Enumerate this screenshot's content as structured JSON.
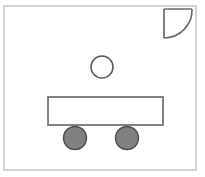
{
  "canvas": {
    "name": "shape-drawing-canvas",
    "width": 205,
    "height": 177,
    "background_color": "#ffffff",
    "description": "Simple line drawing of a cart or vehicle made of basic geometric shapes"
  },
  "frame": {
    "name": "outer-frame",
    "x": 4,
    "y": 6,
    "width": 192,
    "height": 164,
    "stroke_color": "#c9c9c9",
    "stroke_width": 1.6,
    "fill_color": "none"
  },
  "shapes": [
    {
      "id": "quarter-circle",
      "label": "Quarter Circle",
      "role": "corner-arc-shape",
      "corner_x": 192,
      "corner_y": 9,
      "left_x": 164,
      "bottom_y": 38,
      "radius": 28,
      "stroke_color": "#6b6b6b",
      "stroke_width": 1.7,
      "fill_color": "none"
    },
    {
      "id": "circle-outline",
      "label": "Circle",
      "role": "small-open-circle",
      "cx": 102,
      "cy": 67,
      "r": 11,
      "stroke_color": "#585858",
      "stroke_width": 1.5,
      "fill_color": "#ffffff"
    },
    {
      "id": "body-rectangle",
      "label": "Rectangle",
      "role": "cart-body",
      "x": 48,
      "y": 97,
      "width": 115,
      "height": 28,
      "stroke_color": "#6e6e6e",
      "stroke_width": 1.7,
      "fill_color": "#ffffff"
    },
    {
      "id": "wheel-left",
      "label": "Left Wheel",
      "role": "filled-circle",
      "cx": 75,
      "cy": 138,
      "r": 11.5,
      "stroke_color": "#4a4a4a",
      "stroke_width": 1.4,
      "fill_color": "#808080"
    },
    {
      "id": "wheel-right",
      "label": "Right Wheel",
      "role": "filled-circle",
      "cx": 127,
      "cy": 138,
      "r": 11.5,
      "stroke_color": "#4a4a4a",
      "stroke_width": 1.4,
      "fill_color": "#808080"
    }
  ],
  "palette": {
    "background": "#ffffff",
    "frame_gray": "#c9c9c9",
    "outline_gray": "#6b6b6b",
    "fill_gray": "#808080",
    "wheel_outline": "#4a4a4a"
  }
}
